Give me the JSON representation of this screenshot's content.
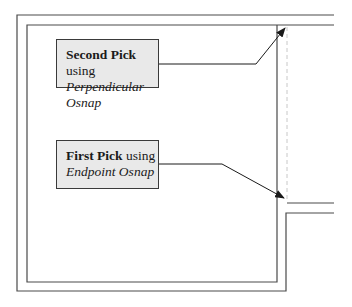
{
  "diagram": {
    "type": "cad-osnap-illustration",
    "colors": {
      "line": "#4a4a4a",
      "callout_fill": "#e9e9e9",
      "callout_border": "#3a3a3a",
      "dashed_guide": "#c8c8c8"
    },
    "callouts": [
      {
        "id": "second-pick",
        "title": "Second Pick",
        "suffix": " using",
        "subtitle": "Perpendicular Osnap"
      },
      {
        "id": "first-pick",
        "title": "First Pick",
        "suffix": " using",
        "subtitle": "Endpoint Osnap"
      }
    ]
  }
}
